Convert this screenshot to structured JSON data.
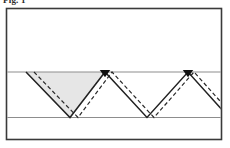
{
  "figure": {
    "label": "Fig. 1",
    "caption_visible": false,
    "canvas": {
      "width": 230,
      "height": 148,
      "background": "#ffffff"
    },
    "frame": {
      "name": "outer-frame",
      "x": 6.5,
      "y": 8.5,
      "width": 215,
      "height": 131,
      "stroke": "#3a3a3a",
      "stroke_width": 1.6,
      "fill": "#ffffff"
    },
    "layers": [
      {
        "name": "upper-layer",
        "y_top": 8.5,
        "y_bottom": 72,
        "fill": "#ffffff"
      },
      {
        "name": "middle-layer",
        "y_top": 72,
        "y_bottom": 117.5,
        "fill": "#ffffff"
      },
      {
        "name": "lower-layer",
        "y_top": 117.5,
        "y_bottom": 139.5,
        "fill": "#ffffff"
      }
    ],
    "interfaces": [
      {
        "name": "upper-interface-line",
        "y": 72,
        "x1": 6.5,
        "x2": 221.5,
        "stroke": "#8d8d8d",
        "stroke_width": 1.1
      },
      {
        "name": "lower-interface-line",
        "y": 117.5,
        "x1": 6.5,
        "x2": 221.5,
        "stroke": "#8d8d8d",
        "stroke_width": 1.1
      }
    ],
    "shaded_region": {
      "name": "shaded-triangle",
      "points": "26,72 105,72 70,117.5",
      "fill": "#e6e6e6",
      "stroke": "none",
      "description": "light grey filled inverted triangle under the first V"
    },
    "solid_zigzag": {
      "name": "solid-zigzag-path",
      "points": "26,72 70,117.5 105,72 147,117.5 188,72 225,113",
      "stroke": "#222222",
      "stroke_width": 1.5,
      "fill": "none"
    },
    "dashed_zigzag": {
      "name": "dashed-zigzag-path",
      "points": "34,72 78,117.5 112,72 154,117.5 194,72 229,111",
      "stroke": "#2a2a2a",
      "stroke_width": 1.2,
      "dash_pattern": "4 2.6",
      "fill": "none"
    },
    "markers": [
      {
        "name": "peak-marker-1",
        "x": 105,
        "y": 72.5,
        "shape": "filled-triangle-down",
        "size": 7.5,
        "fill": "#111111"
      },
      {
        "name": "peak-marker-2",
        "x": 188,
        "y": 72.5,
        "shape": "filled-triangle-down",
        "size": 7.5,
        "fill": "#111111"
      }
    ],
    "colors": {
      "frame": "#3a3a3a",
      "interface_line": "#8d8d8d",
      "solid_ray": "#222222",
      "dashed_ray": "#2a2a2a",
      "shading": "#e6e6e6",
      "marker": "#111111",
      "background": "#ffffff"
    }
  }
}
